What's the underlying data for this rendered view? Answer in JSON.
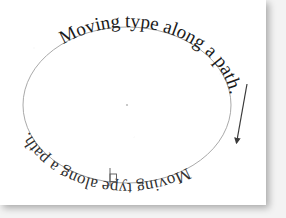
{
  "figure": {
    "caption_text": "Moving type along a path.",
    "path_text_upright": "Moving type along a path.",
    "path_text_flipped": "Moving type along a path.",
    "colors": {
      "page": "#ffffff",
      "backdrop": "#f3f3f3",
      "path_stroke": "#9a9a9a",
      "text_ink": "#1a1a1a",
      "arrow": "#3a3a3a",
      "handle": "#555555",
      "center_dot": "#bdbdbd"
    },
    "ellipse": {
      "center_x": 127,
      "center_y": 105,
      "radius_x": 104,
      "radius_y": 78,
      "stroke_width": 0.8
    },
    "arrow": {
      "name": "direction-arrow",
      "x1": 247,
      "y1": 84,
      "x2": 236,
      "y2": 147,
      "label": "drag direction"
    },
    "handle": {
      "name": "text-start-handle",
      "x": 110,
      "y": 178,
      "label": "type start bracket"
    },
    "center_dot": {
      "x": 127,
      "y": 105
    },
    "type_size_px": 19,
    "type_size_px_flipped": 17
  }
}
